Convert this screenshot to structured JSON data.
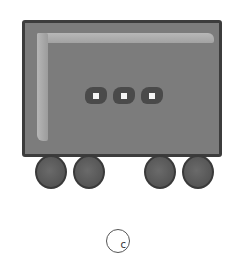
{
  "image": {
    "subject": "box-car",
    "windows_count": 3,
    "wheels_count": 4,
    "colors": {
      "body": "#7c7c7c",
      "border": "#3c3c3c",
      "highlight": "#b4b4b4",
      "window": "#4a4a4a",
      "window_light": "#f6f6f6",
      "wheel": "#5e5e5e"
    }
  },
  "copyright": {
    "symbol_text": "c"
  }
}
